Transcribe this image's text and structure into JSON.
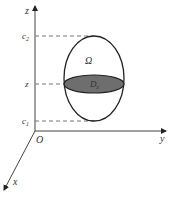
{
  "figure": {
    "axes": {
      "x_label": "x",
      "y_label": "y",
      "z_label": "z",
      "origin_label": "O"
    },
    "levels": {
      "c2_label": "c",
      "c2_sub": "2",
      "z_label": "z",
      "c1_label": "c",
      "c1_sub": "1"
    },
    "region_label": "Ω",
    "slice_label": "D",
    "slice_sub": "z",
    "colors": {
      "line": "#222222",
      "slice_fill": "#6e6e6e",
      "dash": "#777777"
    }
  }
}
